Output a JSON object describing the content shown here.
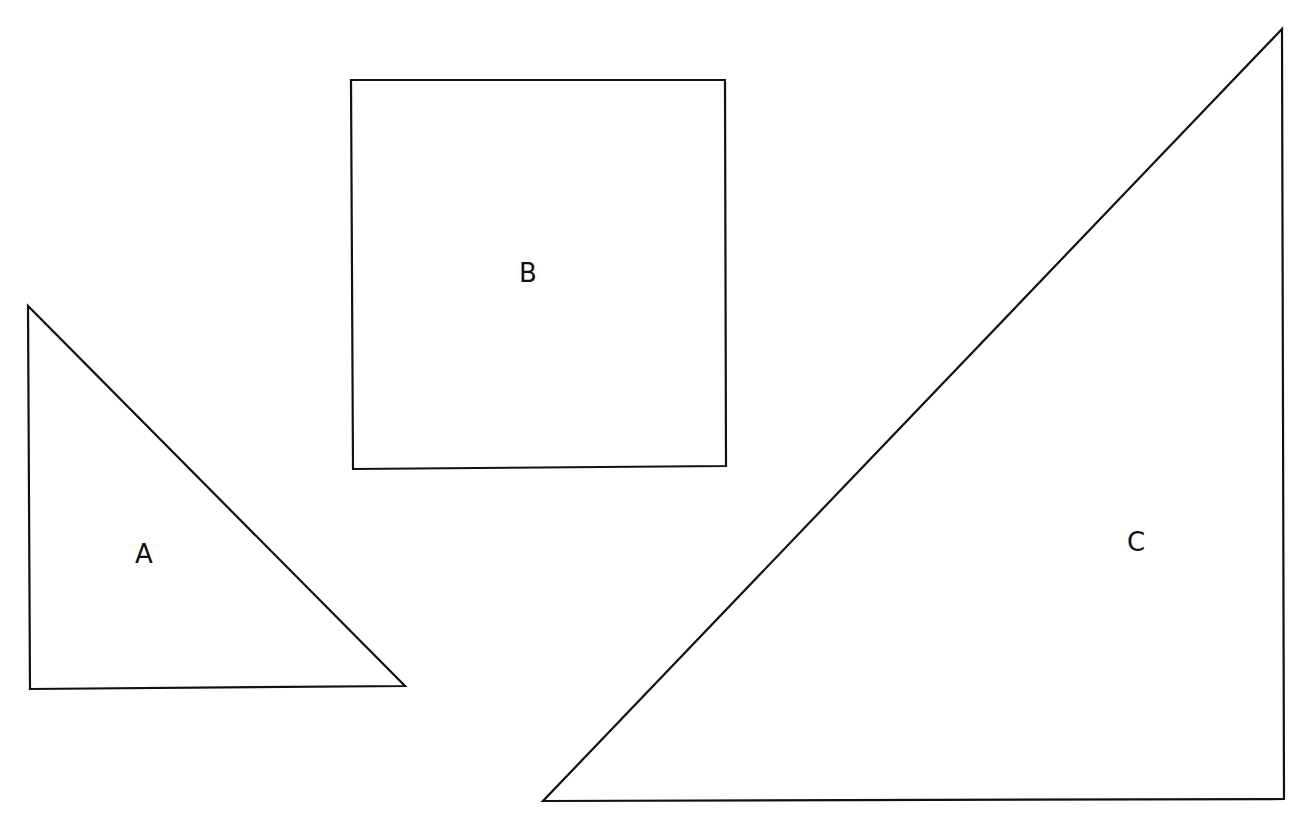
{
  "diagram": {
    "background": "#ffffff",
    "stroke_color": "#111111",
    "shapes": [
      {
        "id": "A",
        "type": "right-triangle",
        "label": "A",
        "points": [
          [
            28,
            306
          ],
          [
            30,
            689
          ],
          [
            405,
            686
          ]
        ],
        "label_pos": [
          144,
          563
        ]
      },
      {
        "id": "B",
        "type": "square",
        "label": "B",
        "points": [
          [
            351,
            80
          ],
          [
            725,
            80
          ],
          [
            726,
            466
          ],
          [
            353,
            469
          ]
        ],
        "label_pos": [
          528,
          282
        ]
      },
      {
        "id": "C",
        "type": "right-triangle",
        "label": "C",
        "points": [
          [
            1282,
            29
          ],
          [
            1284,
            799
          ],
          [
            543,
            801
          ]
        ],
        "label_pos": [
          1136,
          551
        ]
      }
    ]
  }
}
